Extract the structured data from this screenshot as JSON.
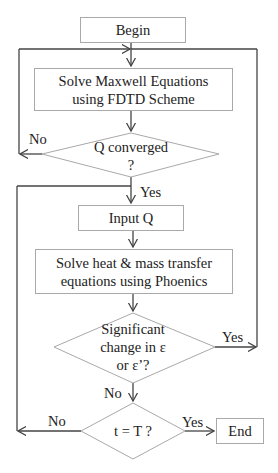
{
  "nodes": {
    "begin": "Begin",
    "maxwell_line1": "Solve Maxwell Equations",
    "maxwell_line2": "using FDTD Scheme",
    "q_converged_line1": "Q converged",
    "q_converged_line2": "?",
    "input_q": "Input Q",
    "heat_line1": "Solve heat & mass transfer",
    "heat_line2": "equations using Phoenics",
    "significant_line1": "Significant",
    "significant_line2": "change in ε",
    "significant_line3": "or ε’?",
    "t_equals_T": "t = T ?",
    "end": "End"
  },
  "edge_labels": {
    "q_no": "No",
    "q_yes": "Yes",
    "sig_yes": "Yes",
    "sig_no": "No",
    "t_no": "No",
    "t_yes": "Yes"
  },
  "colors": {
    "box_border": "#a9a9a9",
    "connector": "#444444",
    "text": "#222222"
  }
}
